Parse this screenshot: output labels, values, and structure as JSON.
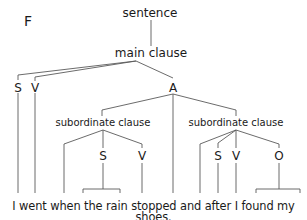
{
  "panel_label": "F",
  "tree": {
    "root": "sentence",
    "main_clause": "main clause",
    "main_children": {
      "subject": "S",
      "verb": "V",
      "adverbial": "A"
    },
    "subordinate_clause_1": {
      "label": "subordinate clause",
      "children": {
        "subject": "S",
        "verb": "V"
      }
    },
    "subordinate_clause_2": {
      "label": "subordinate clause",
      "children": {
        "subject": "S",
        "verb": "V",
        "object": "O"
      }
    }
  },
  "sentence_text": "I went when the rain stopped and after I found my shoes.",
  "line_color": "#555555"
}
